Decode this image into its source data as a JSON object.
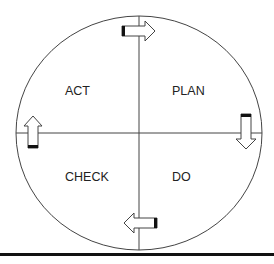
{
  "diagram": {
    "type": "PDCA cycle",
    "quadrants": {
      "top_left": "ACT",
      "top_right": "PLAN",
      "bottom_left": "CHECK",
      "bottom_right": "DO"
    },
    "arrows": [
      {
        "position": "top",
        "direction": "right",
        "icon": "arrow-right-icon"
      },
      {
        "position": "right",
        "direction": "down",
        "icon": "arrow-down-icon"
      },
      {
        "position": "bottom",
        "direction": "left",
        "icon": "arrow-left-icon"
      },
      {
        "position": "left",
        "direction": "up",
        "icon": "arrow-up-icon"
      }
    ],
    "colors": {
      "stroke": "#333333",
      "background": "#ffffff",
      "text": "#222222"
    }
  }
}
